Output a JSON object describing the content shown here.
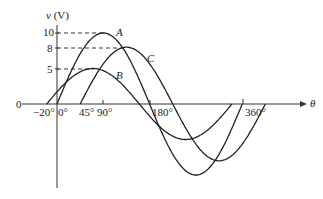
{
  "chart_data": {
    "type": "line",
    "title": "",
    "xlabel": "θ",
    "ylabel": "v (V)",
    "origin_label": "0",
    "x_unit": "degrees",
    "x_ticks": [
      {
        "value": -20,
        "label": "−20°"
      },
      {
        "value": 0,
        "label": "0°"
      },
      {
        "value": 45,
        "label": "45°"
      },
      {
        "value": 90,
        "label": "90°"
      },
      {
        "value": 180,
        "label": "180°"
      },
      {
        "value": 360,
        "label": "360°"
      }
    ],
    "y_ticks": [
      {
        "value": 5,
        "label": "5"
      },
      {
        "value": 8,
        "label": "8"
      },
      {
        "value": 10,
        "label": "10"
      }
    ],
    "series": [
      {
        "name": "A",
        "amplitude": 10,
        "phase_deg": 0,
        "equation": "v = 10 sin(θ)"
      },
      {
        "name": "B",
        "amplitude": 5,
        "phase_deg": 20,
        "equation": "v = 5 sin(θ + 20°)"
      },
      {
        "name": "C",
        "amplitude": 8,
        "phase_deg": -45,
        "equation": "v = 8 sin(θ − 45°)"
      }
    ],
    "xlim": [
      -30,
      420
    ],
    "ylim": [
      -10,
      11
    ],
    "grid": false,
    "guides": [
      "dashed lines from y-axis to peak of each curve at 10, 8, 5"
    ],
    "legend": "curve labels A, B, C placed near peaks"
  },
  "labels": {
    "y_axis": "v (V)",
    "x_axis": "θ",
    "origin": "0",
    "curve_a": "A",
    "curve_b": "B",
    "curve_c": "C",
    "tick_neg20": "−20°",
    "tick_0": "0°",
    "tick_45": "45°",
    "tick_90": "90°",
    "tick_180": "180°",
    "tick_360": "360°",
    "y10": "10",
    "y8": "8",
    "y5": "5"
  }
}
